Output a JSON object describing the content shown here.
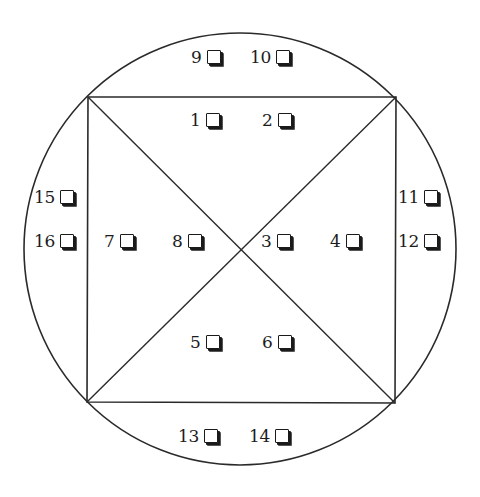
{
  "diagram": {
    "circle": {
      "cx": 240,
      "cy": 249,
      "r": 216
    },
    "square": {
      "top_left": [
        88,
        97
      ],
      "top_right": [
        396,
        97
      ],
      "bottom_right": [
        395,
        403
      ],
      "bottom_left": [
        87,
        402
      ]
    },
    "stroke_color": "#2a2a2a"
  },
  "checkboxes": [
    {
      "id": "cb-1",
      "label": "1",
      "x": 190,
      "y": 120,
      "region": "top-triangle"
    },
    {
      "id": "cb-2",
      "label": "2",
      "x": 262,
      "y": 120,
      "region": "top-triangle"
    },
    {
      "id": "cb-3",
      "label": "3",
      "x": 261,
      "y": 241,
      "region": "right-triangle"
    },
    {
      "id": "cb-4",
      "label": "4",
      "x": 330,
      "y": 241,
      "region": "right-triangle"
    },
    {
      "id": "cb-5",
      "label": "5",
      "x": 190,
      "y": 342,
      "region": "bottom-triangle"
    },
    {
      "id": "cb-6",
      "label": "6",
      "x": 262,
      "y": 342,
      "region": "bottom-triangle"
    },
    {
      "id": "cb-7",
      "label": "7",
      "x": 104,
      "y": 241,
      "region": "left-triangle"
    },
    {
      "id": "cb-8",
      "label": "8",
      "x": 172,
      "y": 241,
      "region": "left-triangle"
    },
    {
      "id": "cb-9",
      "label": "9",
      "x": 191,
      "y": 57,
      "region": "top-segment"
    },
    {
      "id": "cb-10",
      "label": "10",
      "x": 250,
      "y": 57,
      "region": "top-segment"
    },
    {
      "id": "cb-11",
      "label": "11",
      "x": 398,
      "y": 197,
      "region": "right-segment"
    },
    {
      "id": "cb-12",
      "label": "12",
      "x": 398,
      "y": 241,
      "region": "right-segment"
    },
    {
      "id": "cb-13",
      "label": "13",
      "x": 178,
      "y": 436,
      "region": "bottom-segment"
    },
    {
      "id": "cb-14",
      "label": "14",
      "x": 249,
      "y": 436,
      "region": "bottom-segment"
    },
    {
      "id": "cb-15",
      "label": "15",
      "x": 34,
      "y": 197,
      "region": "left-segment"
    },
    {
      "id": "cb-16",
      "label": "16",
      "x": 34,
      "y": 241,
      "region": "left-segment"
    }
  ]
}
